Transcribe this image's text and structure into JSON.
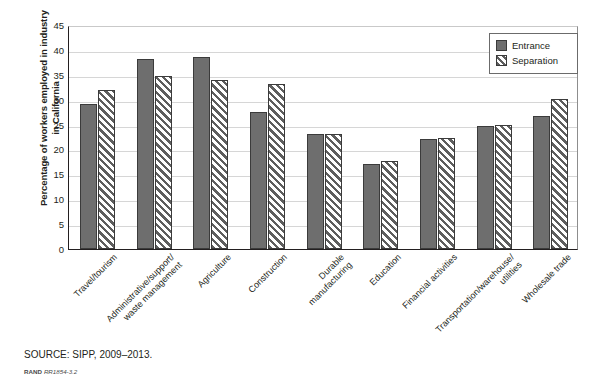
{
  "chart_data": {
    "type": "bar",
    "title": "",
    "xlabel": "",
    "ylabel": "Percentage of workers employed in industry in California",
    "ylabel_lines": [
      "Percentage of workers employed in industry",
      "in California"
    ],
    "ylim": [
      0,
      45
    ],
    "yticks": [
      45,
      40,
      35,
      30,
      25,
      20,
      15,
      10,
      5,
      0
    ],
    "grid": true,
    "legend_position": "top-right",
    "categories": [
      "Travel/tourism",
      "Administrative/support/\nwaste management",
      "Agriculture",
      "Construction",
      "Durable\nmanufacturing",
      "Education",
      "Financial activities",
      "Transportation/warehouse/\nutilities",
      "Wholesale trade"
    ],
    "series": [
      {
        "name": "Entrance",
        "pattern": "solid",
        "color": "#6e6e6e",
        "values": [
          29.1,
          38.1,
          38.5,
          27.6,
          23.1,
          17.0,
          22.1,
          24.8,
          26.8
        ]
      },
      {
        "name": "Separation",
        "pattern": "diagonal-hatch",
        "color": "#5e5e5e",
        "values": [
          32.0,
          34.8,
          33.9,
          33.2,
          23.1,
          17.6,
          22.3,
          25.0,
          30.1
        ]
      }
    ]
  },
  "legend": {
    "entries": [
      {
        "label": "Entrance"
      },
      {
        "label": "Separation"
      }
    ]
  },
  "footer": {
    "source": "SOURCE: SIPP, 2009–2013.",
    "rand_mark": "RAND",
    "rand_number": "RR1854-3.2"
  }
}
